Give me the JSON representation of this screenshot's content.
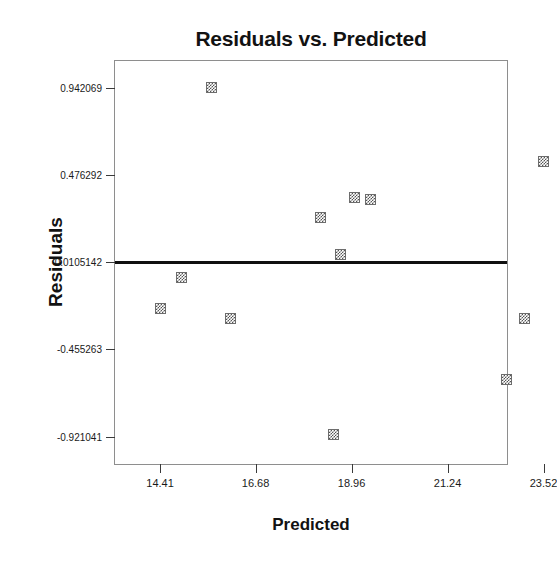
{
  "chart_data": {
    "type": "scatter",
    "title": "Residuals vs. Predicted",
    "xlabel": "Predicted",
    "ylabel": "Residuals",
    "xlim": [
      13.34,
      22.7
    ],
    "ylim": [
      -1.0776,
      1.0835
    ],
    "grid": false,
    "legend": null,
    "xticks": [
      {
        "label": "14.41",
        "value": 14.41
      },
      {
        "label": "16.68",
        "value": 16.68
      },
      {
        "label": "18.96",
        "value": 18.96
      },
      {
        "label": "21.24",
        "value": 21.24
      },
      {
        "label": "23.52",
        "value": 23.52
      }
    ],
    "yticks": [
      {
        "label": "0.942069",
        "value": 0.942069
      },
      {
        "label": "0.476292",
        "value": 0.476292
      },
      {
        "label": "0.0105142",
        "value": 0.0105142
      },
      {
        "label": "-0.455263",
        "value": -0.455263
      },
      {
        "label": "-0.921041",
        "value": -0.921041
      }
    ],
    "reference_line": {
      "y": 0.0105142,
      "orientation": "horizontal"
    },
    "marker_style": "checkered-square",
    "marker_color": "#555555",
    "points": [
      {
        "x": 15.64,
        "y": 0.942069
      },
      {
        "x": 23.53,
        "y": 0.548
      },
      {
        "x": 19.03,
        "y": 0.356
      },
      {
        "x": 19.42,
        "y": 0.345
      },
      {
        "x": 18.22,
        "y": 0.247
      },
      {
        "x": 18.69,
        "y": 0.052
      },
      {
        "x": 14.91,
        "y": -0.07
      },
      {
        "x": 14.41,
        "y": -0.238
      },
      {
        "x": 23.08,
        "y": -0.29
      },
      {
        "x": 16.08,
        "y": -0.29
      },
      {
        "x": 22.65,
        "y": -0.614
      },
      {
        "x": 18.54,
        "y": -0.908
      }
    ]
  }
}
